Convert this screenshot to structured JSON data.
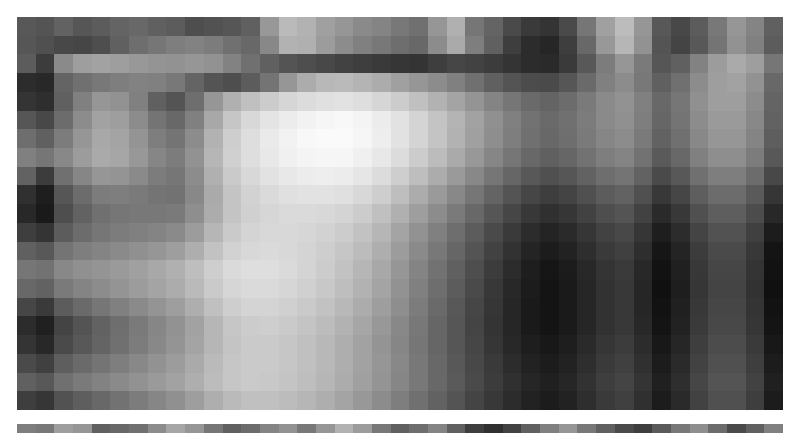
{
  "image": {
    "kind": "pixelated-grayscale-photo",
    "description": "Heavily pixelated (mosaic-censored) grayscale photograph showing a bright blob shape at left-of-centre against a mottled mid-grey field, with a dark region to the right and a checkerboard-textured area at the upper right.",
    "colorspace": "grayscale",
    "background_color": "#ffffff",
    "mosaic": {
      "left": 17,
      "top": 17,
      "width": 766,
      "height": 393,
      "cols": 41,
      "rows": 21,
      "block_width": 18.68,
      "block_height": 18.71,
      "values": [
        [
          88,
          84,
          98,
          86,
          92,
          100,
          104,
          96,
          92,
          78,
          82,
          86,
          96,
          152,
          186,
          178,
          160,
          150,
          138,
          132,
          120,
          112,
          150,
          176,
          118,
          100,
          74,
          58,
          52,
          74,
          118,
          160,
          188,
          150,
          88,
          72,
          92,
          120,
          150,
          132,
          96
        ],
        [
          86,
          80,
          72,
          70,
          78,
          96,
          110,
          118,
          126,
          130,
          124,
          112,
          104,
          136,
          178,
          176,
          156,
          140,
          128,
          120,
          110,
          104,
          140,
          170,
          126,
          96,
          62,
          44,
          38,
          62,
          104,
          152,
          182,
          146,
          84,
          68,
          88,
          116,
          146,
          128,
          92
        ],
        [
          92,
          60,
          138,
          158,
          162,
          158,
          152,
          148,
          146,
          150,
          146,
          130,
          112,
          96,
          84,
          78,
          72,
          66,
          62,
          58,
          54,
          52,
          62,
          70,
          66,
          60,
          52,
          44,
          42,
          58,
          88,
          124,
          150,
          122,
          86,
          96,
          130,
          156,
          170,
          158,
          118
        ],
        [
          44,
          40,
          100,
          112,
          120,
          126,
          130,
          128,
          120,
          100,
          84,
          78,
          92,
          116,
          150,
          172,
          184,
          186,
          180,
          172,
          160,
          150,
          140,
          128,
          112,
          96,
          84,
          76,
          74,
          86,
          106,
          128,
          140,
          120,
          96,
          112,
          140,
          158,
          162,
          146,
          104
        ],
        [
          52,
          46,
          96,
          128,
          150,
          146,
          128,
          96,
          84,
          110,
          150,
          176,
          192,
          204,
          214,
          220,
          224,
          226,
          222,
          214,
          204,
          192,
          178,
          164,
          148,
          132,
          118,
          106,
          100,
          108,
          122,
          138,
          146,
          128,
          104,
          118,
          144,
          158,
          158,
          140,
          100
        ],
        [
          86,
          72,
          108,
          140,
          162,
          158,
          140,
          116,
          104,
          128,
          168,
          198,
          216,
          228,
          236,
          242,
          246,
          248,
          244,
          236,
          226,
          212,
          196,
          180,
          162,
          144,
          128,
          114,
          106,
          112,
          124,
          138,
          144,
          126,
          102,
          116,
          140,
          154,
          154,
          136,
          98
        ],
        [
          110,
          96,
          124,
          150,
          168,
          164,
          148,
          126,
          116,
          140,
          178,
          206,
          222,
          234,
          242,
          248,
          250,
          250,
          246,
          238,
          226,
          212,
          196,
          178,
          160,
          142,
          126,
          112,
          104,
          110,
          122,
          134,
          140,
          122,
          98,
          112,
          136,
          150,
          150,
          132,
          94
        ],
        [
          128,
          118,
          136,
          156,
          170,
          166,
          152,
          134,
          124,
          146,
          182,
          208,
          222,
          232,
          240,
          244,
          246,
          246,
          240,
          232,
          220,
          204,
          188,
          170,
          152,
          134,
          118,
          104,
          96,
          102,
          114,
          126,
          132,
          114,
          90,
          104,
          128,
          142,
          142,
          124,
          88
        ],
        [
          98,
          60,
          112,
          134,
          150,
          148,
          138,
          124,
          118,
          140,
          176,
          202,
          216,
          226,
          232,
          236,
          238,
          236,
          230,
          220,
          206,
          190,
          172,
          154,
          136,
          118,
          102,
          88,
          80,
          86,
          98,
          110,
          116,
          98,
          74,
          88,
          112,
          126,
          126,
          108,
          72
        ],
        [
          48,
          30,
          86,
          108,
          124,
          126,
          122,
          116,
          114,
          136,
          170,
          196,
          210,
          218,
          224,
          226,
          226,
          224,
          216,
          206,
          190,
          172,
          154,
          136,
          118,
          100,
          84,
          70,
          62,
          68,
          80,
          92,
          98,
          80,
          56,
          70,
          94,
          108,
          108,
          90,
          54
        ],
        [
          40,
          26,
          78,
          98,
          112,
          118,
          120,
          120,
          122,
          142,
          172,
          196,
          208,
          214,
          218,
          218,
          216,
          212,
          204,
          192,
          176,
          158,
          140,
          122,
          104,
          86,
          70,
          56,
          48,
          54,
          66,
          78,
          84,
          66,
          42,
          56,
          80,
          94,
          94,
          76,
          40
        ],
        [
          62,
          52,
          92,
          108,
          118,
          124,
          128,
          132,
          138,
          156,
          182,
          202,
          212,
          216,
          216,
          214,
          210,
          204,
          194,
          182,
          164,
          146,
          128,
          110,
          92,
          74,
          58,
          44,
          36,
          42,
          54,
          66,
          72,
          54,
          30,
          44,
          68,
          82,
          82,
          64,
          28
        ],
        [
          96,
          88,
          116,
          126,
          132,
          138,
          144,
          150,
          158,
          174,
          194,
          210,
          216,
          218,
          216,
          212,
          206,
          198,
          188,
          174,
          156,
          138,
          120,
          102,
          84,
          66,
          50,
          36,
          28,
          34,
          46,
          58,
          64,
          46,
          22,
          36,
          60,
          74,
          74,
          56,
          20
        ],
        [
          118,
          114,
          136,
          144,
          148,
          154,
          160,
          168,
          176,
          190,
          206,
          218,
          222,
          222,
          218,
          212,
          204,
          194,
          182,
          168,
          150,
          132,
          114,
          96,
          78,
          60,
          44,
          30,
          22,
          28,
          40,
          52,
          58,
          40,
          18,
          32,
          56,
          70,
          70,
          52,
          18
        ],
        [
          104,
          98,
          122,
          132,
          140,
          148,
          156,
          164,
          172,
          186,
          202,
          214,
          218,
          218,
          214,
          208,
          200,
          190,
          178,
          164,
          146,
          128,
          110,
          92,
          74,
          56,
          40,
          28,
          20,
          26,
          38,
          50,
          56,
          38,
          16,
          30,
          54,
          68,
          68,
          50,
          16
        ],
        [
          70,
          58,
          92,
          106,
          118,
          128,
          138,
          148,
          158,
          174,
          192,
          206,
          212,
          212,
          208,
          202,
          194,
          184,
          172,
          158,
          142,
          124,
          106,
          88,
          70,
          54,
          38,
          26,
          20,
          26,
          38,
          50,
          56,
          38,
          18,
          32,
          56,
          70,
          70,
          52,
          18
        ],
        [
          44,
          32,
          68,
          84,
          98,
          110,
          122,
          134,
          146,
          162,
          182,
          198,
          204,
          206,
          202,
          196,
          188,
          178,
          166,
          152,
          136,
          120,
          102,
          86,
          68,
          52,
          38,
          26,
          20,
          26,
          38,
          50,
          56,
          40,
          20,
          34,
          58,
          72,
          72,
          54,
          20
        ],
        [
          52,
          40,
          74,
          88,
          100,
          112,
          124,
          136,
          148,
          164,
          182,
          196,
          202,
          202,
          198,
          192,
          184,
          174,
          162,
          148,
          134,
          118,
          102,
          86,
          70,
          54,
          40,
          30,
          24,
          30,
          42,
          54,
          60,
          44,
          24,
          38,
          62,
          76,
          76,
          58,
          24
        ],
        [
          74,
          64,
          94,
          106,
          116,
          126,
          136,
          146,
          156,
          170,
          186,
          198,
          202,
          202,
          198,
          192,
          184,
          174,
          162,
          150,
          136,
          120,
          104,
          88,
          72,
          58,
          44,
          34,
          28,
          34,
          46,
          58,
          64,
          48,
          28,
          42,
          66,
          80,
          80,
          62,
          28
        ],
        [
          96,
          88,
          112,
          122,
          130,
          138,
          146,
          154,
          162,
          174,
          188,
          198,
          202,
          200,
          196,
          190,
          182,
          172,
          160,
          148,
          134,
          120,
          104,
          90,
          74,
          60,
          48,
          38,
          32,
          38,
          50,
          62,
          68,
          52,
          32,
          46,
          70,
          84,
          84,
          66,
          32
        ],
        [
          62,
          54,
          82,
          94,
          104,
          114,
          124,
          134,
          144,
          158,
          174,
          186,
          192,
          192,
          188,
          182,
          174,
          164,
          152,
          140,
          126,
          112,
          98,
          84,
          68,
          56,
          44,
          34,
          28,
          34,
          46,
          58,
          64,
          48,
          28,
          42,
          66,
          80,
          80,
          62,
          28
        ]
      ]
    },
    "bottom_strip": {
      "left": 17,
      "top": 424,
      "width": 766,
      "height": 9,
      "cols": 41,
      "rows": 1,
      "values": [
        [
          126,
          120,
          158,
          150,
          96,
          104,
          112,
          140,
          166,
          150,
          118,
          96,
          108,
          132,
          146,
          120,
          150,
          178,
          156,
          120,
          96,
          110,
          132,
          96,
          62,
          48,
          66,
          96,
          128,
          150,
          120,
          96,
          74,
          62,
          90,
          120,
          142,
          108,
          74,
          96,
          128
        ]
      ]
    }
  }
}
